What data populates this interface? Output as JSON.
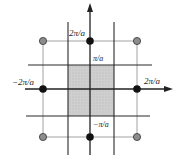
{
  "diagram": {
    "type": "reciprocal-lattice-brillouin-zone",
    "colors": {
      "background": "#ffffff",
      "zone_fill": "#c9c9c9",
      "bold_line": "#2a2a2a",
      "thin_line": "#8a8a8a",
      "black_point": "#111111",
      "grey_point": "#8c8c8c"
    },
    "labels": {
      "top_2pi": "2π/a",
      "top_pi": "π/a",
      "left_neg2pi": "−2π/a",
      "right_2pi": "2π/a",
      "bottom_negpi": "−π/a"
    },
    "points": {
      "black": [
        {
          "name": "nearest-top",
          "x": 90,
          "y": 41
        },
        {
          "name": "nearest-bottom",
          "x": 90,
          "y": 137
        },
        {
          "name": "nearest-left",
          "x": 43,
          "y": 89
        },
        {
          "name": "nearest-right",
          "x": 137,
          "y": 89
        }
      ],
      "grey": [
        {
          "name": "corner-top-left",
          "x": 43,
          "y": 41
        },
        {
          "name": "corner-top-right",
          "x": 137,
          "y": 41
        },
        {
          "name": "corner-bottom-left",
          "x": 43,
          "y": 137
        },
        {
          "name": "corner-bottom-right",
          "x": 137,
          "y": 137
        }
      ]
    }
  }
}
